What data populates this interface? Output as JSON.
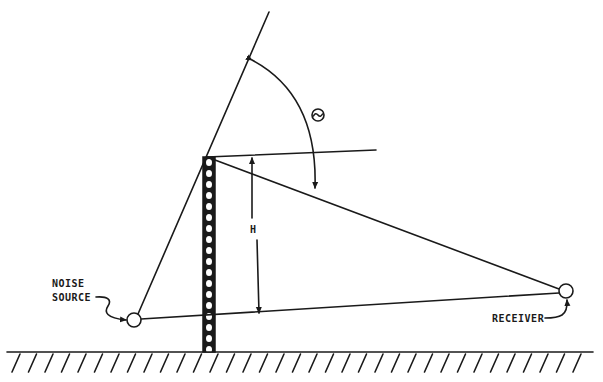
{
  "diagram": {
    "type": "geometry-schematic",
    "labels": {
      "noise_source_line1": "NOISE",
      "noise_source_line2": "SOURCE",
      "receiver": "RECEIVER",
      "height": "H",
      "angle": "Θ"
    },
    "nodes": [
      {
        "id": "noise-source",
        "label": "NOISE SOURCE",
        "shape": "circle"
      },
      {
        "id": "tower",
        "label": "",
        "shape": "lattice-tower"
      },
      {
        "id": "receiver",
        "label": "RECEIVER",
        "shape": "circle"
      }
    ],
    "edges": [
      {
        "from": "noise-source",
        "to": "tower-top",
        "style": "line"
      },
      {
        "from": "tower-top",
        "to": "receiver",
        "style": "line"
      },
      {
        "from": "noise-source",
        "to": "receiver",
        "style": "line"
      },
      {
        "from": "tower-top",
        "to": "horizontal-reference",
        "style": "line"
      }
    ],
    "annotations": [
      {
        "type": "dimension-arrow",
        "label": "H",
        "meaning": "tower height above source-receiver line"
      },
      {
        "type": "angle-arc",
        "label": "Θ",
        "meaning": "angle between extended source ray and tower-receiver ray"
      }
    ],
    "ground": {
      "style": "hatched"
    }
  }
}
